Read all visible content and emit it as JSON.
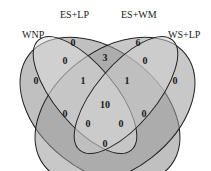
{
  "diagram": {
    "type": "venn-4-set",
    "sets": [
      {
        "id": "wnp",
        "label": "WNP"
      },
      {
        "id": "eslp",
        "label": "ES+LP"
      },
      {
        "id": "eswm",
        "label": "ES+WM"
      },
      {
        "id": "wslp",
        "label": "WS+LP"
      }
    ],
    "regions": {
      "wnp_only": "0",
      "eslp_only": "0",
      "eswm_only": "6",
      "wslp_only": "0",
      "wnp_eslp": "0",
      "eslp_eswm": "3",
      "eswm_wslp": "0",
      "wnp_eslp_eswm": "1",
      "eslp_eswm_wslp": "1",
      "all_four": "10",
      "wnp_eswm": "0",
      "eslp_wslp": "0",
      "wnp_eswm_wslp": "0",
      "wnp_eslp_wslp": "0",
      "wnp_wslp": "0"
    }
  }
}
